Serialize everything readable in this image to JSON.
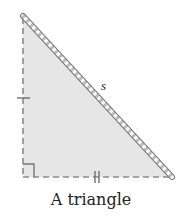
{
  "diagram": {
    "caption": "A triangle",
    "hypotenuse_label": "s",
    "shape": "right isosceles triangle",
    "fill_color": "#e6e6e6",
    "edge_color": "#7a7a7a",
    "marks": {
      "left_leg": "single tick",
      "bottom_leg": "double tick",
      "right_angle": "square marker at bottom-left"
    }
  }
}
